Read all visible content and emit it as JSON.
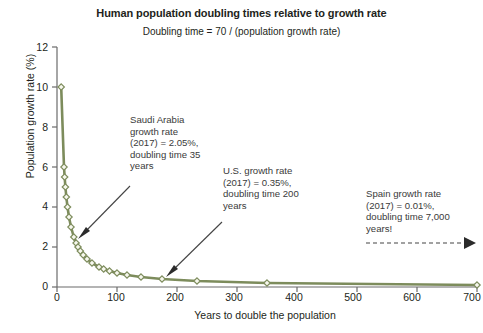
{
  "chart_data": {
    "type": "line",
    "title": "Human population doubling times relative to growth rate",
    "subtitle": "Doubling time = 70 / (population growth rate)",
    "xlabel": "Years to double the population",
    "ylabel": "Population growth rate (%)",
    "xlim": [
      0,
      700
    ],
    "ylim": [
      0,
      12
    ],
    "xticks": [
      0,
      100,
      200,
      300,
      400,
      500,
      600,
      700
    ],
    "yticks": [
      0,
      2,
      4,
      6,
      8,
      10,
      12
    ],
    "grid": false,
    "legend": "none",
    "series": [
      {
        "name": "Doubling time curve (70 / growth rate)",
        "color": "#7d8c5c",
        "marker": "diamond",
        "marker_fill": "#f7f8ee",
        "points": [
          {
            "x": 7,
            "y": 10.0
          },
          {
            "x": 11.67,
            "y": 6.0
          },
          {
            "x": 12.73,
            "y": 5.5
          },
          {
            "x": 14,
            "y": 5.0
          },
          {
            "x": 15.56,
            "y": 4.5
          },
          {
            "x": 17.5,
            "y": 4.0
          },
          {
            "x": 20,
            "y": 3.5
          },
          {
            "x": 23.33,
            "y": 3.0
          },
          {
            "x": 28,
            "y": 2.5
          },
          {
            "x": 31.82,
            "y": 2.2
          },
          {
            "x": 35,
            "y": 2.0
          },
          {
            "x": 38.89,
            "y": 1.8
          },
          {
            "x": 43.75,
            "y": 1.6
          },
          {
            "x": 50,
            "y": 1.4
          },
          {
            "x": 58.33,
            "y": 1.2
          },
          {
            "x": 70,
            "y": 1.0
          },
          {
            "x": 77.78,
            "y": 0.9
          },
          {
            "x": 87.5,
            "y": 0.8
          },
          {
            "x": 100,
            "y": 0.7
          },
          {
            "x": 116.67,
            "y": 0.6
          },
          {
            "x": 140,
            "y": 0.5
          },
          {
            "x": 175,
            "y": 0.4
          },
          {
            "x": 233.33,
            "y": 0.3
          },
          {
            "x": 350,
            "y": 0.2
          },
          {
            "x": 700,
            "y": 0.1
          }
        ]
      }
    ],
    "annotations": [
      {
        "id": "saudi-arabia",
        "text": "Saudi Arabia\ngrowth rate\n(2017) = 2.05%,\ndoubling time 35\nyears",
        "arrow_to": {
          "x": 35,
          "y": 2.05
        }
      },
      {
        "id": "us",
        "text": "U.S. growth rate\n(2017) = 0.35%,\ndoubling time 200\nyears",
        "arrow_to": {
          "x": 200,
          "y": 0.35
        }
      },
      {
        "id": "spain",
        "text": "Spain growth rate\n(2017) = 0.01%,\ndoubling time 7,000\nyears!",
        "arrow_style": "dashed-off-scale"
      }
    ]
  },
  "axis": {
    "y_tick_labels": [
      "12",
      "10",
      "8",
      "6",
      "4",
      "2",
      "0"
    ],
    "x_tick_labels": [
      "0",
      "100",
      "200",
      "300",
      "400",
      "500",
      "600",
      "700"
    ]
  },
  "colors": {
    "line": "#7d8c5c",
    "marker_fill": "#f7f8ee",
    "axis": "#6b6b6b",
    "text": "#231f20",
    "annotation_text": "#3a3a3a",
    "arrow": "#444444"
  }
}
